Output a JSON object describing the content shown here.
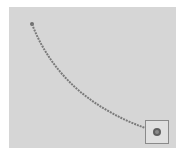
{
  "canvas": {
    "background": "#d6d6d6",
    "path": {
      "start": [
        32,
        24
      ],
      "control": [
        70,
        100
      ],
      "end": [
        157,
        132
      ],
      "color": "#7a7a7a"
    },
    "target": {
      "box": [
        145,
        120,
        23,
        23
      ],
      "box_color": "#8a8a8a",
      "dot_color": "#5a5a5a"
    }
  }
}
